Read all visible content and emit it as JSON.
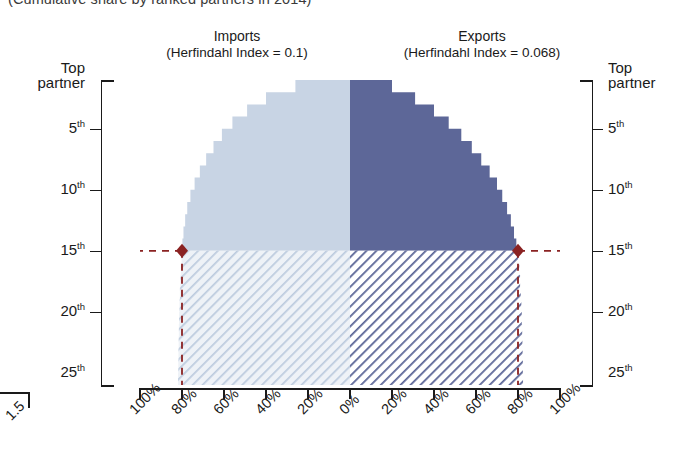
{
  "subtitle": "(Cumulative share by ranked partners in 2014)",
  "panels": {
    "imports": {
      "name": "Imports",
      "index_label": "(Herfindahl Index = 0.1)"
    },
    "exports": {
      "name": "Exports",
      "index_label": "(Herfindahl Index = 0.068)"
    }
  },
  "colors": {
    "imports_fill": "#c8d4e4",
    "imports_hatch_bg": "#eef2f7",
    "imports_hatch_line": "#b9c8dc",
    "exports_fill": "#5d6798",
    "exports_hatch_bg": "#ffffff",
    "exports_hatch_line": "#5d6798",
    "marker": "#8a2222",
    "axis": "#1a1a1a"
  },
  "y_axis": {
    "labels_left": [
      "Top partner",
      "5th",
      "10th",
      "15th",
      "20th",
      "25th"
    ],
    "labels_right": [
      "Top partner",
      "5th",
      "10th",
      "15th",
      "20th",
      "25th"
    ],
    "ranks": [
      1,
      5,
      10,
      15,
      20,
      25
    ]
  },
  "x_axis": {
    "labels": [
      "100%",
      "80%",
      "60%",
      "40%",
      "20%",
      "0%",
      "20%",
      "40%",
      "60%",
      "80%",
      "100%"
    ]
  },
  "corner": {
    "stub_label": "1.5"
  },
  "highlight": {
    "rank": 15,
    "imports_share_pct": 80,
    "exports_share_pct": 80
  },
  "chart_data": {
    "type": "area",
    "subtitle": "(Cumulative share by ranked partners in 2014)",
    "xlabel": "",
    "ylabel": "Partner rank",
    "orientation": "horizontal-mirrored-step",
    "grid": false,
    "legend": "none",
    "ylim": [
      1,
      26
    ],
    "xlim_left": [
      0,
      100
    ],
    "xlim_right": [
      0,
      100
    ],
    "x_tick_labels": [
      "100%",
      "80%",
      "60%",
      "40%",
      "20%",
      "0%",
      "20%",
      "40%",
      "60%",
      "80%",
      "100%"
    ],
    "y_tick_labels": [
      "Top partner",
      "5th",
      "10th",
      "15th",
      "20th",
      "25th"
    ],
    "y_tick_values": [
      1,
      5,
      10,
      15,
      20,
      25
    ],
    "annotations": [
      "Imports (Herfindahl Index = 0.1)",
      "Exports (Herfindahl Index = 0.068)"
    ],
    "series": [
      {
        "name": "Imports",
        "side": "left",
        "herfindahl_index": 0.1,
        "ranks": [
          1,
          2,
          3,
          4,
          5,
          6,
          7,
          8,
          9,
          10,
          11,
          12,
          13,
          14,
          15,
          16,
          17,
          18,
          19,
          20,
          21,
          22,
          23,
          24,
          25
        ],
        "cumulative_share_pct": [
          26,
          40,
          49,
          56,
          61,
          65,
          68.5,
          71.5,
          74,
          76,
          77.5,
          78.5,
          79.3,
          79.8,
          80.2,
          80.5,
          80.8,
          81,
          81.2,
          81.4,
          81.5,
          81.6,
          81.7,
          81.8,
          81.9
        ]
      },
      {
        "name": "Exports",
        "side": "right",
        "herfindahl_index": 0.068,
        "ranks": [
          1,
          2,
          3,
          4,
          5,
          6,
          7,
          8,
          9,
          10,
          11,
          12,
          13,
          14,
          15,
          16,
          17,
          18,
          19,
          20,
          21,
          22,
          23,
          24,
          25
        ],
        "cumulative_share_pct": [
          20,
          31,
          40,
          47,
          53,
          58,
          62.5,
          66.5,
          70,
          72.5,
          74.8,
          76.6,
          78.1,
          79.2,
          80.1,
          80.6,
          81,
          81.3,
          81.6,
          81.8,
          82,
          82.1,
          82.2,
          82.3,
          82.4
        ]
      }
    ],
    "highlight_markers": [
      {
        "series": "Imports",
        "rank": 15,
        "cumulative_share_pct": 80
      },
      {
        "series": "Exports",
        "rank": 15,
        "cumulative_share_pct": 80
      }
    ]
  }
}
